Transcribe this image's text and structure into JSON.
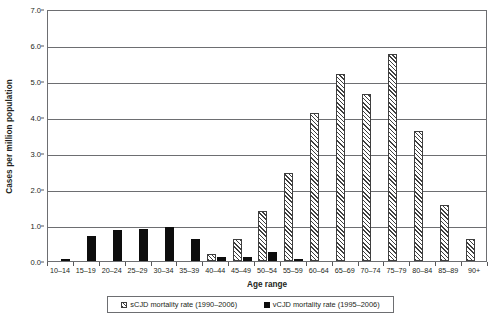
{
  "chart_data": {
    "type": "bar",
    "title": "",
    "xlabel": "Age range",
    "ylabel": "Cases per million population",
    "ylim": [
      0.0,
      7.0
    ],
    "ytick_step": 1.0,
    "ytick_labels": [
      "0.0",
      "1.0",
      "2.0",
      "3.0",
      "4.0",
      "5.0",
      "6.0",
      "7.0"
    ],
    "ytick_values": [
      0.0,
      1.0,
      2.0,
      3.0,
      4.0,
      5.0,
      6.0,
      7.0
    ],
    "grid": "horizontal",
    "legend_position": "bottom",
    "categories": [
      "10–14",
      "15–19",
      "20–24",
      "25–29",
      "30–34",
      "35–39",
      "40–44",
      "45–49",
      "50–54",
      "55–59",
      "60–64",
      "65–69",
      "70–74",
      "75–79",
      "80–84",
      "85–89",
      "90+"
    ],
    "series": [
      {
        "name": "sCJD mortality rate (1990–2006)",
        "pattern": "diagonal-hatch",
        "color": "#efefef",
        "edge_color": "#3f3f3f",
        "values": [
          0.0,
          0.0,
          0.0,
          0.0,
          0.0,
          0.0,
          0.2,
          0.6,
          1.4,
          2.45,
          4.1,
          5.2,
          4.65,
          5.75,
          3.6,
          1.55,
          0.6
        ]
      },
      {
        "name": "vCJD mortality rate (1995–2006)",
        "pattern": "solid",
        "color": "#0d0d0d",
        "edge_color": "#0d0d0d",
        "values": [
          0.05,
          0.7,
          0.85,
          0.9,
          0.95,
          0.6,
          0.1,
          0.1,
          0.25,
          0.05,
          0.0,
          0.0,
          0.0,
          0.0,
          0.0,
          0.0,
          0.0
        ]
      }
    ]
  },
  "legend": {
    "entries": [
      {
        "label": "sCJD mortality rate (1990–2006)",
        "swatch": "hatched-square-icon"
      },
      {
        "label": "vCJD mortality rate (1995–2006)",
        "swatch": "solid-black-square-icon"
      }
    ]
  }
}
